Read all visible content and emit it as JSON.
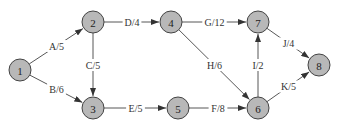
{
  "diagram": {
    "type": "activity-on-arrow network",
    "nodes": [
      {
        "id": "1",
        "x": 20,
        "y": 70
      },
      {
        "id": "2",
        "x": 93,
        "y": 22
      },
      {
        "id": "3",
        "x": 93,
        "y": 108
      },
      {
        "id": "4",
        "x": 171,
        "y": 22
      },
      {
        "id": "5",
        "x": 178,
        "y": 108
      },
      {
        "id": "6",
        "x": 258,
        "y": 108
      },
      {
        "id": "7",
        "x": 258,
        "y": 22
      },
      {
        "id": "8",
        "x": 319,
        "y": 65
      }
    ],
    "edges": [
      {
        "from": "1",
        "to": "2",
        "label": "A/5"
      },
      {
        "from": "1",
        "to": "3",
        "label": "B/6"
      },
      {
        "from": "2",
        "to": "3",
        "label": "C/5"
      },
      {
        "from": "2",
        "to": "4",
        "label": "D/4"
      },
      {
        "from": "3",
        "to": "5",
        "label": "E/5"
      },
      {
        "from": "5",
        "to": "6",
        "label": "F/8"
      },
      {
        "from": "4",
        "to": "7",
        "label": "G/12"
      },
      {
        "from": "4",
        "to": "6",
        "label": "H/6"
      },
      {
        "from": "6",
        "to": "7",
        "label": "I/2"
      },
      {
        "from": "7",
        "to": "8",
        "label": "J/4"
      },
      {
        "from": "6",
        "to": "8",
        "label": "K/5"
      }
    ]
  }
}
